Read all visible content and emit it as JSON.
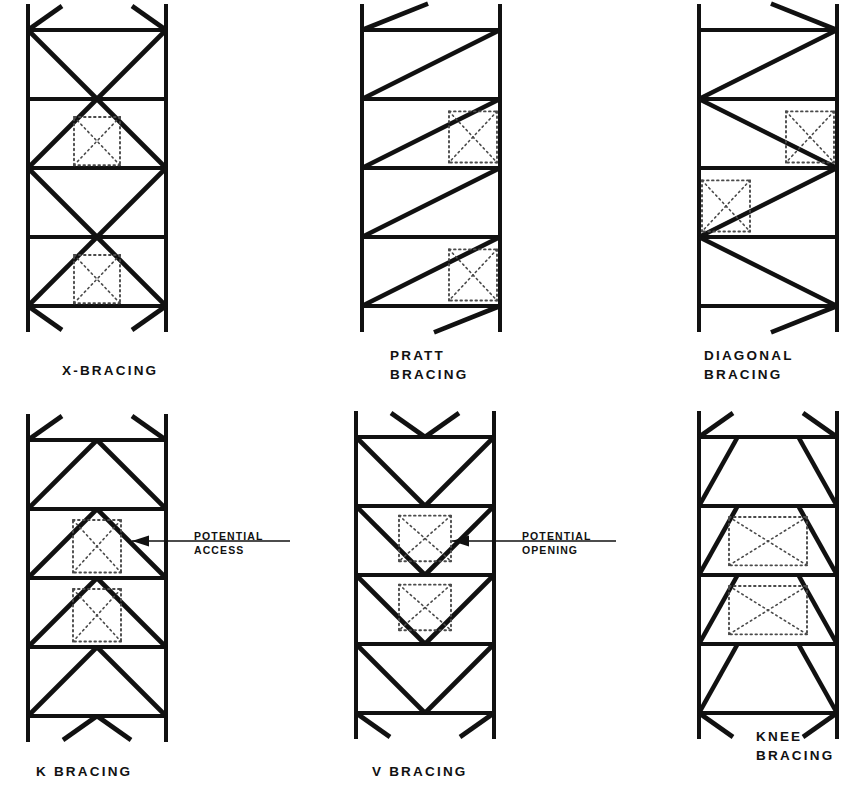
{
  "sheet": {
    "title_note": "Steel frame bracing configuration reference plate",
    "background_color": "#ffffff",
    "line_color": "#111111",
    "dotted_color": "#4a4a4a"
  },
  "panels": [
    {
      "id": "x-bracing",
      "caption_lines": [
        "X-BRACING"
      ],
      "caption_x": 62,
      "caption_y": 361,
      "frame": {
        "x": 28,
        "y": 30,
        "w": 138,
        "h": 276,
        "bays": 4
      },
      "bracing_type": "x",
      "opening_bays": [
        1,
        3
      ],
      "opening_note": "dotted potential opening at bay centers"
    },
    {
      "id": "pratt-bracing",
      "caption_lines": [
        "PRATT",
        "BRACING"
      ],
      "caption_x": 390,
      "caption_y": 346,
      "frame": {
        "x": 362,
        "y": 30,
        "w": 138,
        "h": 276,
        "bays": 4
      },
      "bracing_type": "pratt",
      "opening_bays": [
        1,
        3
      ],
      "opening_note": "dotted potential opening at bay right side"
    },
    {
      "id": "diagonal-bracing",
      "caption_lines": [
        "DIAGONAL",
        "BRACING"
      ],
      "caption_x": 704,
      "caption_y": 346,
      "frame": {
        "x": 699,
        "y": 30,
        "w": 138,
        "h": 276,
        "bays": 4
      },
      "bracing_type": "diagonal",
      "opening_bays": [
        1,
        2
      ],
      "opening_note": "dotted potential openings alternating sides"
    },
    {
      "id": "k-bracing",
      "caption_lines": [
        "K BRACING"
      ],
      "caption_x": 36,
      "caption_y": 762,
      "frame": {
        "x": 28,
        "y": 440,
        "w": 138,
        "h": 276,
        "bays": 4
      },
      "bracing_type": "k",
      "opening_bays": [
        1,
        2
      ],
      "opening_note": "dotted potential access at bay centers"
    },
    {
      "id": "v-bracing",
      "caption_lines": [
        "V BRACING"
      ],
      "caption_x": 372,
      "caption_y": 762,
      "frame": {
        "x": 356,
        "y": 437,
        "w": 138,
        "h": 276,
        "bays": 4
      },
      "bracing_type": "v",
      "opening_bays": [
        1,
        2
      ],
      "opening_note": "dotted potential opening at bay centers"
    },
    {
      "id": "knee-bracing",
      "caption_lines": [
        "KNEE",
        "BRACING"
      ],
      "caption_x": 756,
      "caption_y": 727,
      "frame": {
        "x": 699,
        "y": 437,
        "w": 138,
        "h": 276,
        "bays": 4
      },
      "bracing_type": "knee",
      "opening_bays": [
        1,
        2
      ],
      "opening_note": "dotted potential opening with X inside"
    }
  ],
  "callouts": [
    {
      "id": "potential-access",
      "lines": [
        "POTENTIAL",
        "ACCESS"
      ],
      "text_x": 194,
      "text_y": 529,
      "leader": {
        "x1": 290,
        "y1": 541,
        "x2": 132,
        "y2": 541
      },
      "arrow_at": {
        "x": 132,
        "y": 541
      }
    },
    {
      "id": "potential-opening",
      "lines": [
        "POTENTIAL",
        "OPENING"
      ],
      "text_x": 522,
      "text_y": 529,
      "leader": {
        "x1": 616,
        "y1": 541,
        "x2": 452,
        "y2": 541
      },
      "arrow_at": {
        "x": 452,
        "y": 541
      }
    }
  ]
}
